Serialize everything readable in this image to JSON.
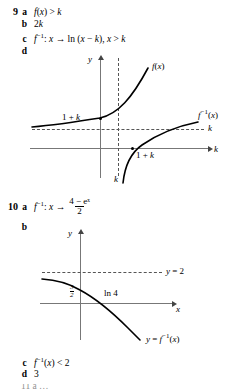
{
  "exercises": [
    {
      "number": "9",
      "parts": [
        {
          "letter": "a",
          "answer": "f(x) > k"
        },
        {
          "letter": "b",
          "answer": "2k"
        },
        {
          "letter": "c",
          "answer": "f⁻¹: x → ln (x − k), x > k"
        },
        {
          "letter": "d",
          "answer": ""
        }
      ]
    },
    {
      "number": "10",
      "parts": [
        {
          "letter": "a",
          "answer": "f⁻¹: x →"
        },
        {
          "letter": "b",
          "answer": ""
        },
        {
          "letter": "c",
          "answer": "f⁻¹(x) < 2"
        },
        {
          "letter": "d",
          "answer": "3"
        }
      ]
    }
  ],
  "q9c": {
    "prefix": "f",
    "inverse": "−1",
    "colon": ": ",
    "var": "x",
    "arrow": " → ",
    "body": "ln (x − k), x > k"
  },
  "q10a": {
    "prefix": "f",
    "inverse": "−1",
    "colon": ": ",
    "var": "x",
    "arrow": " → ",
    "numerator": "4 − eˣ",
    "denominator": "2"
  },
  "q10c": {
    "prefix": "f",
    "inverse": "−1",
    "suffix": "(x) < 2"
  },
  "graph9d": {
    "caption": "d",
    "y_axis_label": "y",
    "x_axis_label": "k",
    "curve_f_label": "f(x)",
    "curve_finv_label": "f⁻¹(x)",
    "y_intercept_label": "1 + k",
    "x_intercept_label": "1 + k",
    "asymptote_horizontal_label": "k",
    "asymptote_vertical_label": "k",
    "description": "y = f(x) exponential curve with horizontal asymptote y = k and y-intercept 1 + k; y = f-inverse(x) logarithmic curve with vertical asymptote x = k and x-intercept 1 + k"
  },
  "graph10b": {
    "caption": "b",
    "y_axis_label": "y",
    "x_axis_label": "x",
    "curve_label": "y = f⁻¹(x)",
    "asymptote_label": "y = 2",
    "y_intercept_num": "3",
    "y_intercept_den": "2",
    "x_intercept_label": "ln 4",
    "description": "decreasing curve y = f-inverse(x) with horizontal asymptote y = 2 above, y-intercept 3/2 and x-intercept ln 4"
  },
  "cut_off_line": "11  a  …",
  "colors": {
    "ink": "#000000",
    "axis": "#777777",
    "dash": "#555555",
    "background": "#ffffff"
  }
}
